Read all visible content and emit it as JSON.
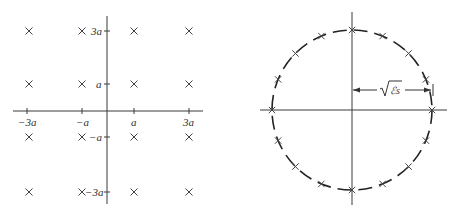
{
  "diagrams": {
    "qam": {
      "title": "16-QAM signal constellation",
      "x_axis_labels": [
        "−3a",
        "−a",
        "a",
        "3a"
      ],
      "y_axis_labels": [
        "3a",
        "a",
        "−a",
        "−3a"
      ],
      "points_levels": [
        -3,
        -1,
        1,
        3
      ],
      "point_symbol": "X"
    },
    "psk": {
      "title": "16-PSK signal constellation",
      "num_points": 16,
      "point_symbol": "X",
      "radius_label": "ℰs",
      "radius_label_prefix": "√"
    }
  }
}
